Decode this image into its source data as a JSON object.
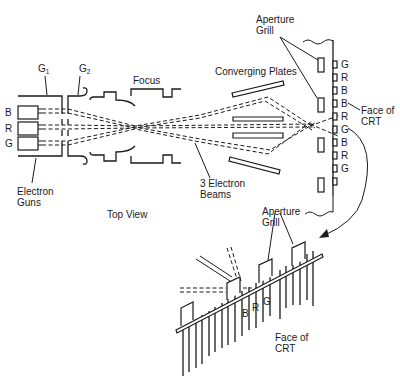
{
  "labels": {
    "g1": "G",
    "g1_sub": "1",
    "g2": "G",
    "g2_sub": "2",
    "focus": "Focus",
    "converging_plates": "Converging Plates",
    "aperture_grill_top_line1": "Aperture",
    "aperture_grill_top_line2": "Grill",
    "gun_b": "B",
    "gun_r": "R",
    "gun_g": "G",
    "electron_guns_line1": "Electron",
    "electron_guns_line2": "Guns",
    "three_beams_line1": "3 Electron",
    "three_beams_line2": "Beams",
    "face_top_line1": "Face of",
    "face_top_line2": "CRT",
    "top_view": "Top View",
    "aperture_grill_bottom_line1": "Aperture",
    "aperture_grill_bottom_line2": "Grill",
    "detail_b": "B",
    "detail_r": "R",
    "detail_g": "G",
    "face_bottom_line1": "Face of",
    "face_bottom_line2": "CRT"
  },
  "phosphor_stripes": [
    "G",
    "R",
    "B",
    "B",
    "R",
    "G",
    "B",
    "R",
    "G"
  ]
}
